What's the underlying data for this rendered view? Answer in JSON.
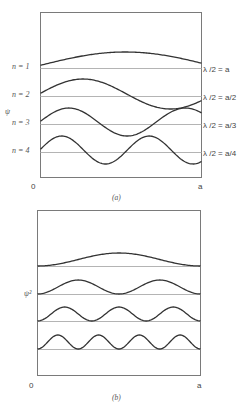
{
  "figure": {
    "panel_a": {
      "caption": "(a)",
      "y_axis_label": "ψ",
      "x_axis_start": "0",
      "x_axis_end": "a",
      "frame": {
        "x": 40,
        "y": 12,
        "w": 161,
        "h": 165
      },
      "curves": [
        {
          "n": 1,
          "left_label": "n = 1",
          "right_label": "λ /2 = a",
          "baseline_y": 68,
          "amplitude": 14,
          "half_waves": 1
        },
        {
          "n": 2,
          "left_label": "n = 2",
          "right_label": "λ /2 = a/2",
          "baseline_y": 96,
          "amplitude": 15,
          "half_waves": 2
        },
        {
          "n": 3,
          "left_label": "n = 3",
          "right_label": "λ /2 = a/3",
          "baseline_y": 124,
          "amplitude": 14,
          "half_waves": 3
        },
        {
          "n": 4,
          "left_label": "n = 4",
          "right_label": "λ /2 = a/4",
          "baseline_y": 152,
          "amplitude": 14,
          "half_waves": 4
        }
      ]
    },
    "panel_b": {
      "caption": "(b)",
      "y_axis_label": "ψ²",
      "x_axis_start": "0",
      "x_axis_end": "a",
      "frame": {
        "x": 37,
        "y": 210,
        "w": 163,
        "h": 165
      },
      "curves": [
        {
          "n": 1,
          "baseline_y": 266,
          "amplitude": 13,
          "half_waves": 1
        },
        {
          "n": 2,
          "baseline_y": 294,
          "amplitude": 14,
          "half_waves": 2
        },
        {
          "n": 3,
          "baseline_y": 321,
          "amplitude": 14,
          "half_waves": 3
        },
        {
          "n": 4,
          "baseline_y": 349,
          "amplitude": 14,
          "half_waves": 4
        }
      ]
    },
    "colors": {
      "curve": "#333333",
      "baseline": "#b4b4b4",
      "frame": "#7a7a7a",
      "text": "#444444"
    }
  }
}
